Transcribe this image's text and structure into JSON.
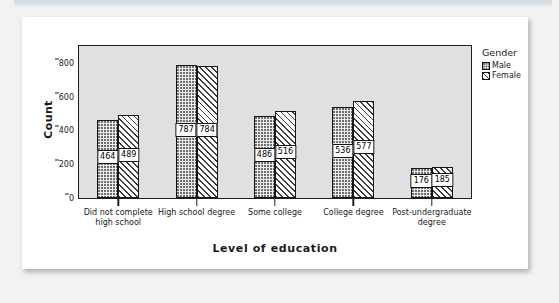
{
  "chart_data": {
    "type": "bar",
    "title": "",
    "xlabel": "Level of education",
    "ylabel": "Count",
    "ylim": [
      0,
      900
    ],
    "yticks": [
      0,
      200,
      400,
      600,
      800
    ],
    "grid": false,
    "legend_position": "right",
    "legend_title": "Gender",
    "categories": [
      "Did not complete high school",
      "High school degree",
      "Some college",
      "College degree",
      "Post-undergraduate degree"
    ],
    "series": [
      {
        "name": "Male",
        "pattern": "dotted",
        "values": [
          464,
          787,
          486,
          536,
          176
        ]
      },
      {
        "name": "Female",
        "pattern": "diagonal-hatch",
        "values": [
          489,
          784,
          516,
          577,
          185
        ]
      }
    ]
  },
  "axis": {
    "y_title": "Count",
    "x_title": "Level of education",
    "y_tick_labels": [
      "800",
      "600",
      "400",
      "200",
      "0"
    ]
  },
  "legend": {
    "title": "Gender",
    "items": [
      {
        "label": "Male"
      },
      {
        "label": "Female"
      }
    ]
  },
  "colors": {
    "plot_background": "#e0e0e0",
    "card_background": "#ffffff",
    "page_background": "#f2f2f2",
    "axis": "#1f1f1f",
    "text": "#1a1a1a"
  }
}
